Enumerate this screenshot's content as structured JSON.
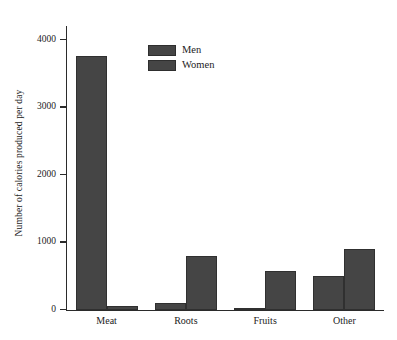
{
  "chart_data": {
    "type": "bar",
    "title": "",
    "xlabel": "",
    "ylabel": "Number of calories produced per day",
    "categories": [
      "Meat",
      "Roots",
      "Fruits",
      "Other"
    ],
    "series": [
      {
        "name": "Men",
        "values": [
          3750,
          100,
          30,
          500
        ]
      },
      {
        "name": "Women",
        "values": [
          50,
          800,
          570,
          900
        ]
      }
    ],
    "ylim": [
      0,
      4200
    ],
    "yticks": [
      0,
      1000,
      2000,
      3000,
      4000
    ],
    "ytick_labels": [
      "0",
      "1000",
      "2000",
      "3000",
      "4000"
    ],
    "grid": false,
    "legend_position": "top-center",
    "bar_color": "#454545",
    "axis_color": "#2b2b2b",
    "background": "#ffffff"
  },
  "legend": {
    "entries": [
      {
        "label": "Men",
        "color": "#454545"
      },
      {
        "label": "Women",
        "color": "#454545"
      }
    ]
  },
  "axes": {
    "y_title": "Number of calories produced per day"
  }
}
